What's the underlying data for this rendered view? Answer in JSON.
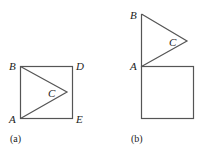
{
  "panels": [
    {
      "caption": "(a)",
      "labels": {
        "A": "A",
        "B": "B",
        "C": "C",
        "D": "D",
        "E": "E"
      }
    },
    {
      "caption": "(b)",
      "labels": {
        "A": "A",
        "B": "B",
        "C": "C"
      }
    }
  ],
  "colors": {
    "stroke": "#555555",
    "text": "#222222"
  }
}
